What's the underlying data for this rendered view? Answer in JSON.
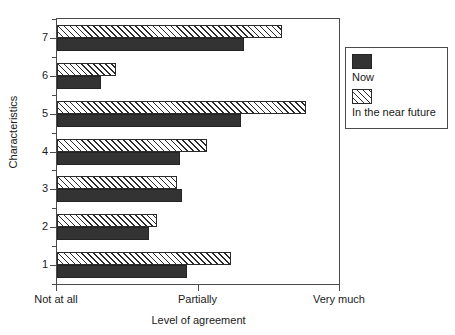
{
  "chart_data": {
    "type": "bar",
    "orientation": "horizontal",
    "title": "",
    "xlabel": "Level of agreement",
    "ylabel": "Characteristics",
    "categories": [
      "1",
      "2",
      "3",
      "4",
      "5",
      "6",
      "7"
    ],
    "xlim": [
      0,
      2
    ],
    "xtick_values": [
      0,
      1,
      2
    ],
    "xtick_labels": [
      "Not at all",
      "Partially",
      "Very much"
    ],
    "ytick_labels": [
      "1",
      "2",
      "3",
      "4",
      "5",
      "6",
      "7"
    ],
    "grid": false,
    "legend_position": "right",
    "series": [
      {
        "name": "Now",
        "fill": "solid",
        "color": "#333333",
        "values": [
          0.92,
          0.65,
          0.88,
          0.87,
          1.3,
          0.31,
          1.32
        ]
      },
      {
        "name": "In the near future",
        "fill": "hatched",
        "color": "#ffffff",
        "values": [
          1.23,
          0.71,
          0.85,
          1.06,
          1.76,
          0.42,
          1.59
        ]
      }
    ]
  },
  "axes": {
    "y_title": "Characteristics",
    "x_title": "Level of agreement",
    "x_ticks": [
      {
        "label": "Not at all",
        "value": 0
      },
      {
        "label": "Partially",
        "value": 1
      },
      {
        "label": "Very much",
        "value": 2
      }
    ],
    "y_ticks": [
      {
        "label": "7",
        "value": 7
      },
      {
        "label": "6",
        "value": 6
      },
      {
        "label": "5",
        "value": 5
      },
      {
        "label": "4",
        "value": 4
      },
      {
        "label": "3",
        "value": 3
      },
      {
        "label": "2",
        "value": 2
      },
      {
        "label": "1",
        "value": 1
      }
    ]
  },
  "legend": {
    "items": [
      {
        "label": "Now",
        "swatch": "solid-dark-square-icon"
      },
      {
        "label": "In the near future",
        "swatch": "hatched-square-icon"
      }
    ]
  },
  "colors": {
    "now_fill": "#333333",
    "future_fill": "#ffffff",
    "hatch_stroke": "#2b2b2b",
    "axis": "#4a4a4a",
    "text": "#1a1a1a",
    "background": "#ffffff"
  }
}
